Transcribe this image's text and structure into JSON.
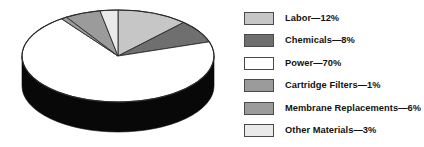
{
  "chart_data": {
    "type": "pie",
    "title": "",
    "xlabel": "",
    "ylabel": "",
    "legend_position": "right",
    "grid": false,
    "unit": "%",
    "categories": [
      "Labor",
      "Chemicals",
      "Power",
      "Cartridge Filters",
      "Membrane Replacements",
      "Other Materials"
    ],
    "values": [
      12,
      8,
      70,
      1,
      6,
      3
    ],
    "labels": [
      "Labor—12%",
      "Chemicals—8%",
      "Power—70%",
      "Cartridge Filters—1%",
      "Membrane Replacements—6%",
      "Other Materials—3%"
    ],
    "colors": [
      "#c6c6c6",
      "#6f6f6f",
      "#ffffff",
      "#9b9b9b",
      "#9b9b9b",
      "#eaeaea"
    ],
    "slice_geometry": [
      {
        "name": "Labor",
        "start_deg": 0,
        "end_deg": 43.2
      },
      {
        "name": "Chemicals",
        "start_deg": 43.2,
        "end_deg": 72.0
      },
      {
        "name": "Power",
        "start_deg": 72.0,
        "end_deg": 324.0
      },
      {
        "name": "Cartridge Filters",
        "start_deg": 324.0,
        "end_deg": 327.6
      },
      {
        "name": "Membrane Replacements",
        "start_deg": 327.6,
        "end_deg": 349.2
      },
      {
        "name": "Other Materials",
        "start_deg": 349.2,
        "end_deg": 360.0
      }
    ],
    "style": {
      "three_d": true,
      "side_color": "#080808",
      "outline_color": "#2a2a2a",
      "center_x": 118,
      "center_y": 56,
      "radius_x": 96,
      "radius_y": 46,
      "depth": 30
    }
  },
  "legend": {
    "items": [
      {
        "label": "Labor—12%",
        "swatch": "#c6c6c6"
      },
      {
        "label": "Chemicals—8%",
        "swatch": "#6f6f6f"
      },
      {
        "label": "Power—70%",
        "swatch": "#ffffff"
      },
      {
        "label": "Cartridge Filters—1%",
        "swatch": "#9b9b9b"
      },
      {
        "label": "Membrane Replacements—6%",
        "swatch": "#9b9b9b"
      },
      {
        "label": "Other Materials—3%",
        "swatch": "#eaeaea"
      }
    ]
  }
}
